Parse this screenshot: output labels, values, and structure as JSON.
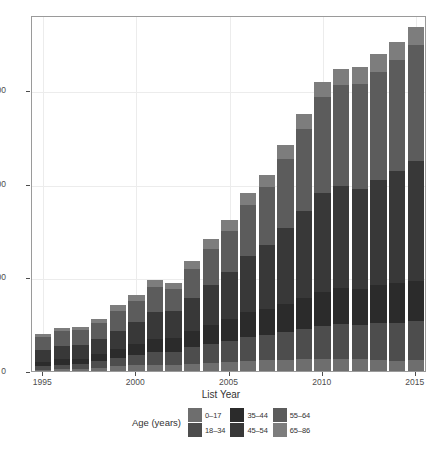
{
  "chart_data": {
    "type": "bar",
    "stacked": true,
    "title": "",
    "subtitle": "",
    "xlabel": "List Year",
    "ylabel": "",
    "legend_title": "Age (years)",
    "legend_position": "bottom",
    "grid": true,
    "xlim": [
      1994.4,
      2015.6
    ],
    "ylim": [
      0,
      1900
    ],
    "yticks": [
      0,
      500,
      1000,
      1500
    ],
    "ytick_labels": [
      "0",
      "500",
      "1000",
      "1500"
    ],
    "xticks": [
      1995,
      2000,
      2005,
      2010,
      2015
    ],
    "xtick_labels": [
      "1995",
      "2000",
      "2005",
      "2010",
      "2015"
    ],
    "categories": [
      1995,
      1996,
      1997,
      1998,
      1999,
      2000,
      2001,
      2002,
      2003,
      2004,
      2005,
      2006,
      2007,
      2008,
      2009,
      2010,
      2011,
      2012,
      2013,
      2014,
      2015
    ],
    "series": [
      {
        "name": "0-17",
        "color": "#6e6e6e",
        "values": [
          6,
          10,
          10,
          18,
          26,
          30,
          34,
          32,
          40,
          44,
          50,
          54,
          58,
          60,
          62,
          64,
          66,
          62,
          60,
          56,
          58
        ]
      },
      {
        "name": "18-34",
        "color": "#4d4d4d",
        "values": [
          20,
          24,
          26,
          34,
          44,
          56,
          68,
          70,
          86,
          100,
          112,
          128,
          134,
          146,
          160,
          176,
          184,
          184,
          196,
          202,
          208
        ]
      },
      {
        "name": "35-44",
        "color": "#2b2b2b",
        "values": [
          24,
          28,
          30,
          38,
          46,
          58,
          70,
          72,
          88,
          104,
          116,
          132,
          140,
          152,
          166,
          182,
          192,
          190,
          202,
          210,
          214
        ]
      },
      {
        "name": "45-54",
        "color": "#383838",
        "values": [
          60,
          72,
          74,
          80,
          98,
          116,
          142,
          146,
          176,
          210,
          248,
          300,
          338,
          404,
          468,
          528,
          548,
          536,
          560,
          600,
          642
        ]
      },
      {
        "name": "55-64",
        "color": "#5c5c5c",
        "values": [
          72,
          80,
          78,
          84,
          106,
          114,
          134,
          118,
          156,
          194,
          222,
          272,
          310,
          370,
          438,
          512,
          536,
          560,
          580,
          590,
          616
        ]
      },
      {
        "name": "65-86",
        "color": "#7d7d7d",
        "values": [
          14,
          16,
          18,
          24,
          30,
          32,
          36,
          34,
          42,
          50,
          56,
          62,
          66,
          72,
          78,
          82,
          86,
          88,
          92,
          96,
          100
        ]
      }
    ],
    "totals": [
      196,
      230,
      236,
      278,
      350,
      406,
      484,
      472,
      588,
      702,
      804,
      948,
      1046,
      1204,
      1372,
      1544,
      1612,
      1620,
      1690,
      1754,
      1838
    ]
  },
  "axis": {
    "xlabel": "List Year"
  },
  "legend": {
    "title": "Age (years)",
    "items": [
      {
        "label": "0-17",
        "color": "#6e6e6e"
      },
      {
        "label": "18-34",
        "color": "#4d4d4d"
      },
      {
        "label": "35-44",
        "color": "#2b2b2b"
      },
      {
        "label": "45-54",
        "color": "#383838"
      },
      {
        "label": "55-64",
        "color": "#5c5c5c"
      },
      {
        "label": "65-86",
        "color": "#7d7d7d"
      }
    ]
  }
}
